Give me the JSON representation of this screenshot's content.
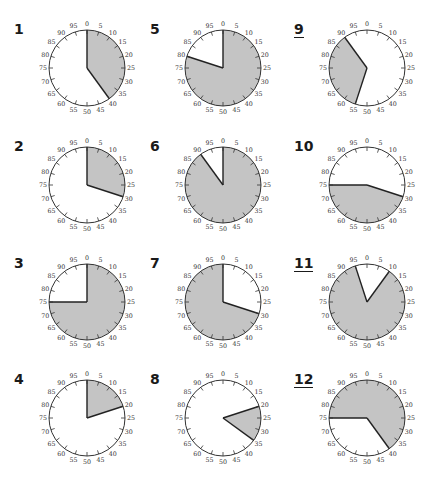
{
  "figure": {
    "colors": {
      "shade": "#c4c4c4",
      "outline": "#333333",
      "boundary": "#222222",
      "background": "#ffffff"
    },
    "tick_labels": [
      "0",
      "5",
      "10",
      "15",
      "20",
      "25",
      "30",
      "35",
      "40",
      "45",
      "50",
      "55",
      "60",
      "65",
      "70",
      "75",
      "80",
      "85",
      "90",
      "95"
    ]
  },
  "dials": [
    {
      "label": "1",
      "underlined": false,
      "shade_from": 0,
      "shade_to": 40,
      "col": 0,
      "row": 0
    },
    {
      "label": "2",
      "underlined": false,
      "shade_from": 0,
      "shade_to": 30,
      "col": 0,
      "row": 1
    },
    {
      "label": "3",
      "underlined": false,
      "shade_from": 0,
      "shade_to": 75,
      "col": 0,
      "row": 2
    },
    {
      "label": "4",
      "underlined": false,
      "shade_from": 0,
      "shade_to": 20,
      "col": 0,
      "row": 3
    },
    {
      "label": "5",
      "underlined": false,
      "shade_from": 0,
      "shade_to": 80,
      "col": 1,
      "row": 0
    },
    {
      "label": "6",
      "underlined": false,
      "shade_from": 0,
      "shade_to": 90,
      "col": 1,
      "row": 1
    },
    {
      "label": "7",
      "underlined": false,
      "shade_from": 30,
      "shade_to": 100,
      "col": 1,
      "row": 2
    },
    {
      "label": "8",
      "underlined": false,
      "shade_from": 20,
      "shade_to": 35,
      "col": 1,
      "row": 3
    },
    {
      "label": "9",
      "underlined": true,
      "shade_from": 55,
      "shade_to": 90,
      "col": 2,
      "row": 0
    },
    {
      "label": "10",
      "underlined": false,
      "shade_from": 30,
      "shade_to": 75,
      "col": 2,
      "row": 1
    },
    {
      "label": "11",
      "underlined": true,
      "shade_from": 10,
      "shade_to": 95,
      "col": 2,
      "row": 2
    },
    {
      "label": "12",
      "underlined": true,
      "shade_from": 75,
      "shade_to": 140,
      "col": 2,
      "row": 3
    }
  ]
}
